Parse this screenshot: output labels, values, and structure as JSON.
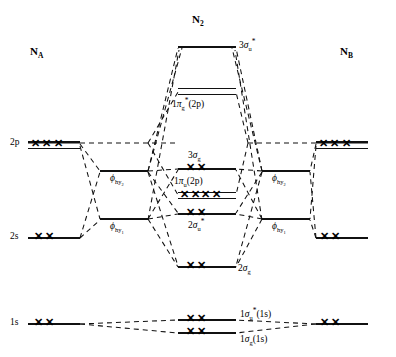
{
  "atoms": {
    "left_label": "N",
    "left_sub": "A",
    "right_label": "N",
    "right_sub": "B",
    "molecule_label": "N",
    "molecule_sub": "2"
  },
  "atomic_orbitals": {
    "left": [
      {
        "name": "2p",
        "label": "2p",
        "electrons": "✕✕✕",
        "x": 28,
        "y": 143,
        "w": 52,
        "type": "trp"
      },
      {
        "name": "2s",
        "label": "2s",
        "electrons": "✕✕",
        "x": 28,
        "y": 237,
        "w": 52,
        "type": "single"
      },
      {
        "name": "1s",
        "label": "1s",
        "electrons": "✕✕",
        "x": 28,
        "y": 323,
        "w": 52,
        "type": "single"
      }
    ],
    "right": [
      {
        "name": "2p",
        "label": "",
        "electrons": "✕✕✕",
        "x": 316,
        "y": 143,
        "w": 52,
        "type": "trp"
      },
      {
        "name": "2s",
        "label": "",
        "electrons": "✕✕",
        "x": 316,
        "y": 237,
        "w": 52,
        "type": "single"
      },
      {
        "name": "1s",
        "label": "",
        "electrons": "✕✕",
        "x": 316,
        "y": 323,
        "w": 52,
        "type": "single"
      }
    ]
  },
  "hybrid_orbitals": {
    "left": [
      {
        "label_base": "ϕ",
        "label_sub": "hy",
        "label_sub2": "2",
        "x": 100,
        "y": 170,
        "w": 48
      },
      {
        "label_base": "ϕ",
        "label_sub": "hy",
        "label_sub2": "1",
        "x": 100,
        "y": 218,
        "w": 48
      }
    ],
    "right": [
      {
        "label_base": "ϕ",
        "label_sub": "hy",
        "label_sub2": "2",
        "x": 262,
        "y": 170,
        "w": 48
      },
      {
        "label_base": "ϕ",
        "label_sub": "hy",
        "label_sub2": "1",
        "x": 262,
        "y": 218,
        "w": 48
      }
    ]
  },
  "molecular_orbitals": [
    {
      "name": "3sigma-u-star",
      "base": "3",
      "greek": "σ",
      "sub": "u",
      "star": "*",
      "suffix": "",
      "electrons": "",
      "x": 178,
      "y": 46,
      "w": 58,
      "type": "single",
      "label_x": 238,
      "label_y": 39,
      "label_side": "right",
      "elec_x": 0,
      "elec_y": 0
    },
    {
      "name": "1pi-g-star-2p",
      "base": "1",
      "greek": "π",
      "sub": "g",
      "star": "*",
      "suffix": "(2p)",
      "electrons": "",
      "x": 178,
      "y": 90,
      "w": 58,
      "type": "dbl",
      "label_x": 178,
      "label_y": 98,
      "label_side": "below",
      "elec_x": 0,
      "elec_y": 0
    },
    {
      "name": "3sigma-g",
      "base": "3",
      "greek": "σ",
      "sub": "g",
      "star": "",
      "suffix": "",
      "electrons": "✕✕",
      "x": 178,
      "y": 168,
      "w": 58,
      "type": "single",
      "label_x": 186,
      "label_y": 152,
      "label_side": "above",
      "elec_x": 186,
      "elec_y": 161
    },
    {
      "name": "1pi-u-2p",
      "base": "1",
      "greek": "π",
      "sub": "u",
      "star": "",
      "suffix": "(2p)",
      "electrons": "✕✕✕✕",
      "x": 178,
      "y": 193,
      "w": 58,
      "type": "dbl",
      "label_x": 176,
      "label_y": 179,
      "label_side": "above",
      "elec_x": 181,
      "elec_y": 189
    },
    {
      "name": "2sigma-u-star",
      "base": "2",
      "greek": "σ",
      "sub": "u",
      "star": "*",
      "suffix": "",
      "electrons": "✕✕",
      "x": 178,
      "y": 213,
      "w": 58,
      "type": "single",
      "label_x": 186,
      "label_y": 219,
      "label_side": "below",
      "elec_x": 186,
      "elec_y": 206
    },
    {
      "name": "2sigma-g",
      "base": "2",
      "greek": "σ",
      "sub": "g",
      "star": "",
      "suffix": "",
      "electrons": "✕✕",
      "x": 178,
      "y": 266,
      "w": 58,
      "type": "single",
      "label_x": 238,
      "label_y": 263,
      "label_side": "right",
      "elec_x": 186,
      "elec_y": 259
    },
    {
      "name": "1sigma-u-star-1s",
      "base": "1",
      "greek": "σ",
      "sub": "u",
      "star": "*",
      "suffix": "(1s)",
      "electrons": "✕✕",
      "x": 178,
      "y": 319,
      "w": 58,
      "type": "single",
      "label_x": 240,
      "label_y": 309,
      "label_side": "right",
      "elec_x": 186,
      "elec_y": 312
    },
    {
      "name": "1sigma-g-1s",
      "base": "1",
      "greek": "σ",
      "sub": "g",
      "star": "",
      "suffix": "(1s)",
      "electrons": "✕✕",
      "x": 178,
      "y": 332,
      "w": 58,
      "type": "single",
      "label_x": 240,
      "label_y": 336,
      "label_side": "right",
      "elec_x": 186,
      "elec_y": 325
    }
  ],
  "colors": {
    "line": "#111111",
    "background": "#ffffff"
  }
}
